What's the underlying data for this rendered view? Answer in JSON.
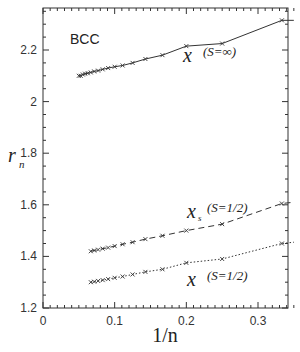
{
  "chart_data": {
    "type": "line",
    "title": "",
    "annotation": "BCC",
    "xlabel": "1/n",
    "ylabel": "r_n",
    "xlim": [
      0,
      0.35
    ],
    "ylim": [
      1.2,
      2.36
    ],
    "xticks": [
      "0",
      "0.1",
      "0.2",
      "0.3"
    ],
    "yticks": [
      "1.2",
      "1.4",
      "1.6",
      "1.8",
      "2",
      "2.2"
    ],
    "grid": false,
    "series": [
      {
        "name": "x (S=∞)",
        "label_main": "x",
        "label_sub": "",
        "label_paren": "(S=∞)",
        "style": "solid",
        "x": [
          0.05,
          0.0526,
          0.0556,
          0.0588,
          0.0625,
          0.0667,
          0.0714,
          0.0769,
          0.0833,
          0.0909,
          0.1,
          0.1111,
          0.125,
          0.1429,
          0.1667,
          0.2,
          0.25,
          0.3333,
          0.35
        ],
        "y": [
          2.1,
          2.1,
          2.105,
          2.108,
          2.11,
          2.113,
          2.117,
          2.12,
          2.125,
          2.13,
          2.135,
          2.14,
          2.15,
          2.165,
          2.18,
          2.215,
          2.225,
          2.315,
          2.315
        ]
      },
      {
        "name": "x_s (S=1/2)",
        "label_main": "x",
        "label_sub": "s",
        "label_paren": "(S=1/2)",
        "style": "dashed",
        "x": [
          0.0667,
          0.0714,
          0.0769,
          0.0833,
          0.0909,
          0.1,
          0.1111,
          0.125,
          0.1429,
          0.1667,
          0.2,
          0.25,
          0.3333,
          0.35
        ],
        "y": [
          1.42,
          1.423,
          1.426,
          1.43,
          1.434,
          1.44,
          1.447,
          1.455,
          1.467,
          1.48,
          1.5,
          1.525,
          1.605,
          1.61
        ]
      },
      {
        "name": "x (S=1/2)",
        "label_main": "x",
        "label_sub": "",
        "label_paren": "(S=1/2)",
        "style": "dotted",
        "x": [
          0.0667,
          0.0714,
          0.0769,
          0.0833,
          0.0909,
          0.1,
          0.1111,
          0.125,
          0.1429,
          0.1667,
          0.2,
          0.25,
          0.3333,
          0.35
        ],
        "y": [
          1.3,
          1.302,
          1.305,
          1.308,
          1.312,
          1.317,
          1.322,
          1.33,
          1.34,
          1.35,
          1.375,
          1.39,
          1.45,
          1.455
        ]
      }
    ]
  }
}
